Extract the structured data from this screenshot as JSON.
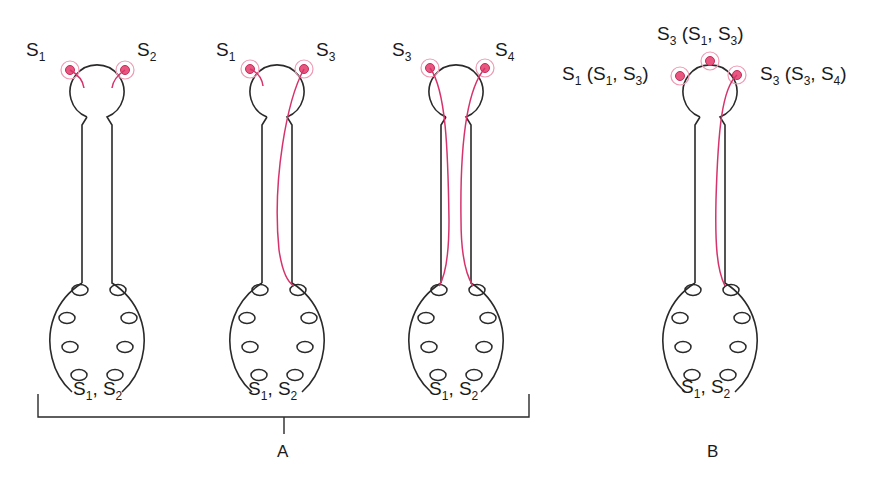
{
  "figure": {
    "panels": [
      {
        "id": "A1",
        "stigma_labels": [
          {
            "main": "S",
            "sub": "1"
          },
          {
            "main": "S",
            "sub": "2"
          }
        ],
        "pistil_genotype": {
          "text": [
            {
              "main": "S",
              "sub": "1"
            },
            {
              "sep": ", "
            },
            {
              "main": "S",
              "sub": "2"
            }
          ]
        },
        "tube_growth": [
          "arrested",
          "arrested"
        ]
      },
      {
        "id": "A2",
        "stigma_labels": [
          {
            "main": "S",
            "sub": "1"
          },
          {
            "main": "S",
            "sub": "3"
          }
        ],
        "pistil_genotype": {
          "text": [
            {
              "main": "S",
              "sub": "1"
            },
            {
              "sep": ", "
            },
            {
              "main": "S",
              "sub": "2"
            }
          ]
        },
        "tube_growth": [
          "arrested",
          "reaches-ovule"
        ]
      },
      {
        "id": "A3",
        "stigma_labels": [
          {
            "main": "S",
            "sub": "3"
          },
          {
            "main": "S",
            "sub": "4"
          }
        ],
        "pistil_genotype": {
          "text": [
            {
              "main": "S",
              "sub": "1"
            },
            {
              "sep": ", "
            },
            {
              "main": "S",
              "sub": "2"
            }
          ]
        },
        "tube_growth": [
          "reaches-ovule",
          "reaches-ovule"
        ]
      },
      {
        "id": "B",
        "stigma_labels": [
          {
            "label": "S1 (S1, S3)"
          },
          {
            "label": "S3 (S1, S3)"
          },
          {
            "label": "S3 (S3, S4)"
          }
        ],
        "pistil_genotype": {
          "text": [
            {
              "main": "S",
              "sub": "1"
            },
            {
              "sep": ", "
            },
            {
              "main": "S",
              "sub": "2"
            }
          ]
        },
        "tube_growth": [
          "none",
          "none",
          "reaches-ovule"
        ]
      }
    ],
    "labels": {
      "A1_left": {
        "main": "S",
        "sub": "1"
      },
      "A1_right": {
        "main": "S",
        "sub": "2"
      },
      "A2_left": {
        "main": "S",
        "sub": "1"
      },
      "A2_right": {
        "main": "S",
        "sub": "3"
      },
      "A3_left": {
        "main": "S",
        "sub": "3"
      },
      "A3_right": {
        "main": "S",
        "sub": "4"
      },
      "B_left": {
        "a": "S",
        "a_sub": "1",
        "b": " (S",
        "b_sub": "1",
        "c": ", S",
        "c_sub": "3",
        "d": ")"
      },
      "B_top": {
        "a": "S",
        "a_sub": "3",
        "b": " (S",
        "b_sub": "1",
        "c": ", S",
        "c_sub": "3",
        "d": ")"
      },
      "B_right": {
        "a": "S",
        "a_sub": "3",
        "b": " (S",
        "b_sub": "3",
        "c": ", S",
        "c_sub": "4",
        "d": ")"
      },
      "genotype": {
        "a": "S",
        "a_sub": "1",
        "b": ", S",
        "b_sub": "2"
      }
    },
    "panel_labels": {
      "A": "A",
      "B": "B"
    },
    "colors": {
      "outline": "#2a2a2a",
      "pollen_tube": "#d6336c",
      "pollen_grain": "#e8577f",
      "pollen_halo": "#ef9ab4"
    }
  }
}
